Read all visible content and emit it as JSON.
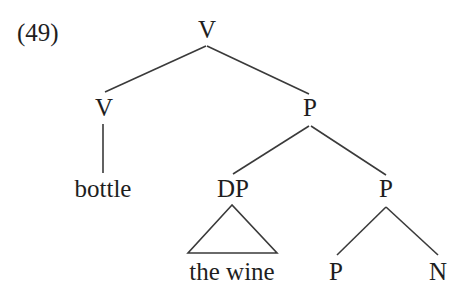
{
  "example_number": "(49)",
  "tree": {
    "root": {
      "label": "V"
    },
    "nodes": {
      "v_left": {
        "label": "V"
      },
      "p_right": {
        "label": "P"
      },
      "bottle": {
        "label": "bottle"
      },
      "dp": {
        "label": "DP"
      },
      "p_mid": {
        "label": "P"
      },
      "the_wine": {
        "label": "the wine"
      },
      "p_low": {
        "label": "P"
      },
      "n_low": {
        "label": "N"
      }
    },
    "structure": "[V [V bottle] [P [DP the wine] [P P N]]]"
  },
  "colors": {
    "ink": "#1e1e1e",
    "lines": "#3a3a3a",
    "background": "#ffffff"
  }
}
